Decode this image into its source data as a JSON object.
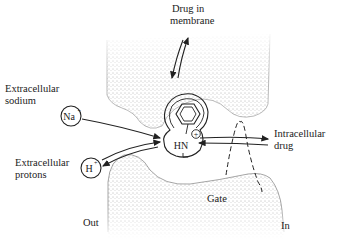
{
  "diagram": {
    "labels": {
      "drug_in_membrane": [
        "Drug in",
        "membrane"
      ],
      "extracellular_sodium": [
        "Extracellular",
        "sodium"
      ],
      "extracellular_protons": [
        "Extracellular",
        "protons"
      ],
      "intracellular_drug": [
        "Intracellular",
        "drug"
      ],
      "gate": "Gate",
      "out": "Out",
      "in": "In"
    },
    "ions": {
      "sodium": {
        "symbol": "Na",
        "charge": "+"
      },
      "proton": {
        "symbol": "H",
        "charge": "+"
      }
    },
    "drug": {
      "amine": "HN",
      "charge": "+"
    },
    "colors": {
      "ink": "#222222",
      "stipple": "#555555",
      "background": "#ffffff"
    }
  }
}
